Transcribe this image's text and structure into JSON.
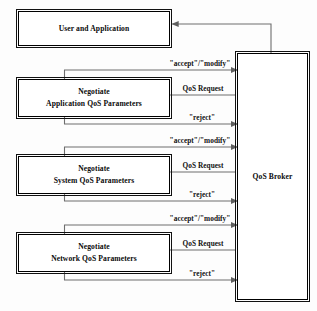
{
  "diagram": {
    "background_color": "#fdfdfd",
    "line_color": "#6e6e6e",
    "box_border_color": "#000000",
    "nodes": {
      "user_application": {
        "label": "User and Application"
      },
      "negotiate_application": {
        "line1": "Negotiate",
        "line2": "Application QoS Parameters"
      },
      "negotiate_system": {
        "line1": "Negotiate",
        "line2": "System QoS Parameters"
      },
      "negotiate_network": {
        "line1": "Negotiate",
        "line2": "Network QoS Parameters"
      },
      "qos_broker": {
        "label": "QoS Broker"
      }
    },
    "edges": {
      "application": {
        "accept_modify": "\"accept\"/\"modify\"",
        "qos_request": "QoS Request",
        "reject": "\"reject\""
      },
      "system": {
        "accept_modify": "\"accept\"/\"modify\"",
        "qos_request": "QoS Request",
        "reject": "\"reject\""
      },
      "network": {
        "accept_modify": "\"accept\"/\"modify\"",
        "qos_request": "QoS Request",
        "reject": "\"reject\""
      }
    }
  }
}
